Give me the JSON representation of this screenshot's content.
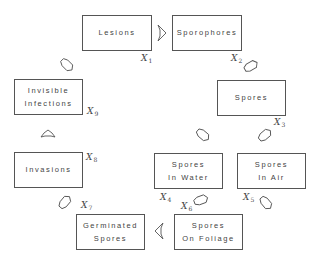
{
  "diagram": {
    "type": "cycle-flow",
    "nodes": [
      {
        "id": "lesions",
        "lines": [
          "Lesions"
        ],
        "variable": "X",
        "subscript": "1"
      },
      {
        "id": "sporophores",
        "lines": [
          "Sporophores"
        ],
        "variable": "X",
        "subscript": "2"
      },
      {
        "id": "spores",
        "lines": [
          "Spores"
        ],
        "variable": "X",
        "subscript": "3"
      },
      {
        "id": "spores-in-water",
        "lines": [
          "Spores",
          "In Water"
        ],
        "variable": "X",
        "subscript": "4"
      },
      {
        "id": "spores-in-air",
        "lines": [
          "Spores",
          "In Air"
        ],
        "variable": "X",
        "subscript": "5"
      },
      {
        "id": "spores-on-foliage",
        "lines": [
          "Spores",
          "On Foliage"
        ],
        "variable": "X",
        "subscript": "6"
      },
      {
        "id": "germinated-spores",
        "lines": [
          "Germinated",
          "Spores"
        ],
        "variable": "X",
        "subscript": "7"
      },
      {
        "id": "invasions",
        "lines": [
          "Invasions"
        ],
        "variable": "X",
        "subscript": "8"
      },
      {
        "id": "invisible-infections",
        "lines": [
          "Invisible",
          "Infections"
        ],
        "variable": "X",
        "subscript": "9"
      }
    ],
    "edges": [
      {
        "from": "lesions",
        "to": "sporophores"
      },
      {
        "from": "sporophores",
        "to": "spores"
      },
      {
        "from": "spores",
        "to": "spores-in-water"
      },
      {
        "from": "spores",
        "to": "spores-in-air"
      },
      {
        "from": "spores-in-air",
        "to": "spores-on-foliage"
      },
      {
        "from": "spores-in-water",
        "to": "spores-on-foliage"
      },
      {
        "from": "spores-on-foliage",
        "to": "germinated-spores"
      },
      {
        "from": "germinated-spores",
        "to": "invasions"
      },
      {
        "from": "invasions",
        "to": "invisible-infections"
      },
      {
        "from": "invisible-infections",
        "to": "lesions"
      }
    ]
  }
}
